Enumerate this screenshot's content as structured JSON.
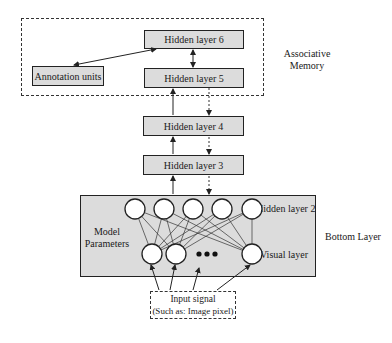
{
  "associative_memory": {
    "label_line1": "Associative",
    "label_line2": "Memory",
    "hidden_layer_6": "Hidden layer 6",
    "hidden_layer_5": "Hidden layer 5",
    "annotation_units": "Annotation units"
  },
  "middle": {
    "hidden_layer_4": "Hidden layer 4",
    "hidden_layer_3": "Hidden layer 3"
  },
  "bottom_layer": {
    "label": "Bottom Layer",
    "hidden_layer_2": "Hidden layer 2",
    "model_parameters_line1": "Model",
    "model_parameters_line2": "Parameters",
    "visual_layer": "Visual layer",
    "hidden_units_count": 5,
    "visible_units_shown": 3
  },
  "input": {
    "line1": "Input signal",
    "line2": "(Such as: Image pixel)"
  },
  "colors": {
    "box_fill": "#dcdcdc",
    "stroke": "#222222",
    "node_fill": "#ffffff"
  }
}
